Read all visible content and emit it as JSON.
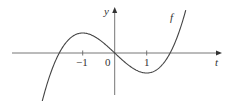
{
  "chart_data": {
    "type": "line",
    "title": "",
    "xlabel": "t",
    "ylabel": "y",
    "function_label": "f",
    "x_ticks": [
      {
        "value": -1,
        "label": "−1"
      },
      {
        "value": 0,
        "label": "0"
      },
      {
        "value": 1,
        "label": "1"
      }
    ],
    "series": [
      {
        "name": "f",
        "x": [
          -2.25,
          -2.0,
          -1.73,
          -1.5,
          -1.0,
          -0.5,
          0,
          0.5,
          1.0,
          1.5,
          1.73,
          2.0,
          2.25
        ],
        "values": [
          -4.64,
          -2.0,
          0,
          1.13,
          2.0,
          1.38,
          0,
          -1.38,
          -2.0,
          -1.13,
          0,
          2.0,
          4.64
        ]
      }
    ],
    "xlim": [
      -3.2,
      3.4
    ],
    "grid": false,
    "legend": "none"
  },
  "labels": {
    "y_axis": "y",
    "x_axis": "t",
    "curve": "f",
    "tick_neg1": "−1",
    "origin": "0",
    "tick_1": "1"
  },
  "colors": {
    "axis": "#555555",
    "curve": "#444444",
    "text": "#333333"
  }
}
